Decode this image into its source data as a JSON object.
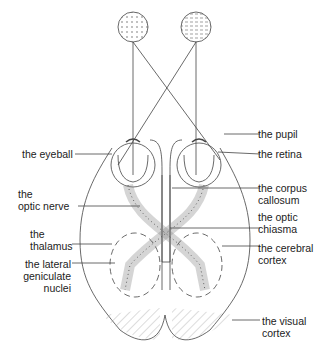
{
  "labels": {
    "pupil": "the pupil",
    "eyeball": "the eyeball",
    "retina": "the retina",
    "optic_nerve": "the\noptic nerve",
    "corpus_callosum": "the corpus\ncallosum",
    "optic_chiasma": "the optic\nchiasma",
    "thalamus": "the\nthalamus",
    "cerebral_cortex": "the cerebral\ncortex",
    "lgn": "the lateral\ngeniculate\nnuclei",
    "visual_cortex": "the visual\ncortex"
  },
  "colors": {
    "line": "#444444",
    "text": "#222222",
    "background": "#ffffff"
  }
}
